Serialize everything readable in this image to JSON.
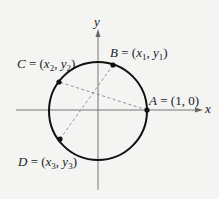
{
  "diagram": {
    "type": "unit-circle",
    "background": "#f4f4f3",
    "axes": {
      "x_label": "x",
      "y_label": "y",
      "color": "#555555"
    },
    "circle": {
      "color": "#111111",
      "center": [
        98,
        111
      ],
      "radius": 49
    },
    "points": [
      {
        "id": "A",
        "name": "A",
        "coords": "(1, 0)"
      },
      {
        "id": "B",
        "name": "B",
        "x": "x",
        "x_sub": "1",
        "y": "y",
        "y_sub": "1"
      },
      {
        "id": "C",
        "name": "C",
        "x": "x",
        "x_sub": "2",
        "y": "y",
        "y_sub": "2"
      },
      {
        "id": "D",
        "name": "D",
        "x": "x",
        "x_sub": "3",
        "y": "y",
        "y_sub": "3"
      }
    ],
    "dashed_chords": [
      {
        "from": "A",
        "to": "C"
      },
      {
        "from": "B",
        "to": "D"
      }
    ],
    "eq": " = ",
    "open": "(",
    "comma": ", ",
    "close": ")"
  }
}
